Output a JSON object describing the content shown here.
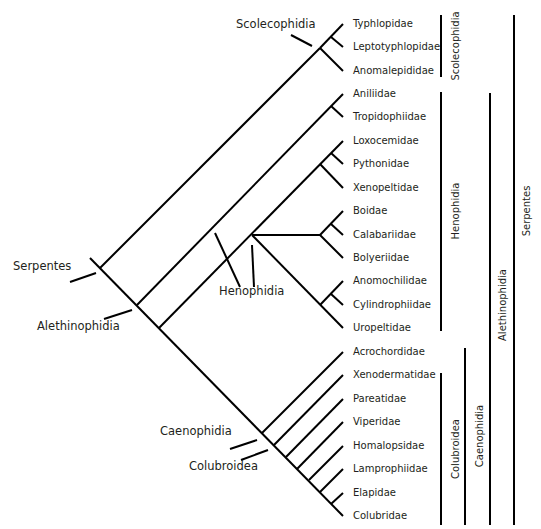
{
  "colors": {
    "line": "#000000",
    "text": "#231f20",
    "background": "#ffffff"
  },
  "taxa": [
    {
      "name": "Typhlopidae",
      "y": 24
    },
    {
      "name": "Leptotyphlopidae",
      "y": 47
    },
    {
      "name": "Anomalepididae",
      "y": 71
    },
    {
      "name": "Aniliidae",
      "y": 94
    },
    {
      "name": "Tropidophiidae",
      "y": 117
    },
    {
      "name": "Loxocemidae",
      "y": 141
    },
    {
      "name": "Pythonidae",
      "y": 164
    },
    {
      "name": "Xenopeltidae",
      "y": 188
    },
    {
      "name": "Boidae",
      "y": 211
    },
    {
      "name": "Calabariidae",
      "y": 235
    },
    {
      "name": "Bolyeriidae",
      "y": 258
    },
    {
      "name": "Anomochilidae",
      "y": 281
    },
    {
      "name": "Cylindrophiidae",
      "y": 305
    },
    {
      "name": "Uropeltidae",
      "y": 328
    },
    {
      "name": "Acrochordidae",
      "y": 352
    },
    {
      "name": "Xenodermatidae",
      "y": 375
    },
    {
      "name": "Pareatidae",
      "y": 399
    },
    {
      "name": "Viperidae",
      "y": 422
    },
    {
      "name": "Homalopsidae",
      "y": 446
    },
    {
      "name": "Lamprophiidae",
      "y": 469
    },
    {
      "name": "Elapidae",
      "y": 493
    },
    {
      "name": "Colubridae",
      "y": 516
    }
  ],
  "node_labels": [
    {
      "name": "Scolecophidia",
      "x": 236,
      "y": 24
    },
    {
      "name": "Serpentes",
      "x": 13,
      "y": 266
    },
    {
      "name": "Alethinophidia",
      "x": 37,
      "y": 326
    },
    {
      "name": "Henophidia",
      "x": 219,
      "y": 291
    },
    {
      "name": "Caenophidia",
      "x": 160,
      "y": 431
    },
    {
      "name": "Colubroidea",
      "x": 189,
      "y": 466
    }
  ],
  "side_bars": [
    {
      "name": "Scolecophidia",
      "x": 441,
      "y1": 15,
      "y2": 77,
      "label_x": 456
    },
    {
      "name": "Henophidia",
      "x": 441,
      "y1": 92,
      "y2": 331,
      "label_x": 456
    },
    {
      "name": "Colubroidea",
      "x": 441,
      "y1": 373,
      "y2": 525,
      "label_x": 456
    },
    {
      "name": "Caenophidia",
      "x": 465,
      "y1": 348,
      "y2": 525,
      "label_x": 480
    },
    {
      "name": "Alethinophidia",
      "x": 490,
      "y1": 93,
      "y2": 525,
      "label_x": 503
    },
    {
      "name": "Serpentes",
      "x": 514,
      "y1": 15,
      "y2": 525,
      "label_x": 527
    }
  ],
  "side_bar_label_y": {
    "Scolecophidia": 46,
    "Henophidia": 211,
    "Colubroidea": 449,
    "Caenophidia": 436,
    "Alethinophidia": 305,
    "Serpentes": 211
  }
}
